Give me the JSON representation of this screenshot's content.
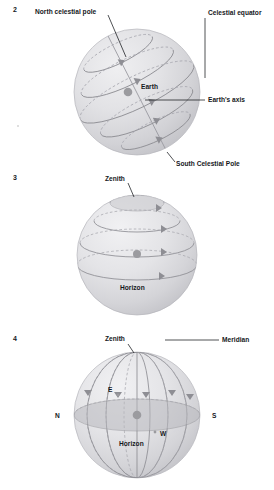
{
  "figure": {
    "background_color": "#ffffff",
    "sphere_color": "#d9d9dd",
    "line_color": "#8e8e94",
    "dash_color": "#a9a9b0",
    "label_color": "#15181c",
    "dot_color": "#9b9b9f"
  },
  "panels": [
    {
      "number": "2",
      "labels": {
        "north_celestial_pole": "North celestial pole",
        "celestial_equator": "Celestial equator",
        "earth": "Earth",
        "earths_axis": "Earth's axis",
        "south_celestial_pole": "South Celestial Pole"
      }
    },
    {
      "number": "3",
      "labels": {
        "zenith": "Zenith",
        "horizon": "Horizon"
      }
    },
    {
      "number": "4",
      "labels": {
        "zenith": "Zenith",
        "meridian": "Meridian",
        "north": "N",
        "east": "E",
        "west": "W",
        "south": "S",
        "horizon": "Horizon"
      }
    }
  ]
}
